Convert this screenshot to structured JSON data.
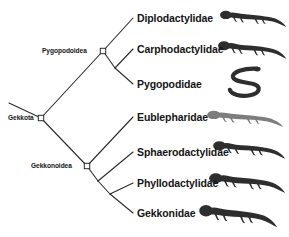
{
  "figure": {
    "type": "phylogenetic-cladogram",
    "background_color": "#ffffff",
    "line_color": "#2b2b2b",
    "text_color": "#151515",
    "node_marker": {
      "shape": "square",
      "fill": "#ffffff",
      "stroke": "#2b2b2b"
    }
  },
  "clade_labels": [
    {
      "id": "gekkota",
      "text": "Gekkota",
      "x": 8,
      "y": 114,
      "node_x": 41,
      "node_y": 118
    },
    {
      "id": "pygopodoidea",
      "text": "Pygopodoidea",
      "x": 42,
      "y": 47,
      "node_x": 103,
      "node_y": 51
    },
    {
      "id": "gekkonoidea",
      "text": "Gekkonoidea",
      "x": 31,
      "y": 162,
      "node_x": 87,
      "node_y": 166
    }
  ],
  "taxa": [
    {
      "id": "diplodactylidae",
      "text": "Diplodactylidae",
      "x": 137,
      "y": 13,
      "tip_x": 133,
      "tip_y": 18
    },
    {
      "id": "carphodactylidae",
      "text": "Carphodactylidae",
      "x": 137,
      "y": 44,
      "tip_x": 133,
      "tip_y": 49
    },
    {
      "id": "pygopodidae",
      "text": "Pygopodidae",
      "x": 137,
      "y": 79,
      "tip_x": 133,
      "tip_y": 84
    },
    {
      "id": "eublepharidae",
      "text": "Eublepharidae",
      "x": 137,
      "y": 112,
      "tip_x": 133,
      "tip_y": 117
    },
    {
      "id": "sphaerodactylidae",
      "text": "Sphaerodactylidae",
      "x": 137,
      "y": 147,
      "tip_x": 133,
      "tip_y": 152
    },
    {
      "id": "phyllodactylidae",
      "text": "Phyllodactylidae",
      "x": 137,
      "y": 178,
      "tip_x": 133,
      "tip_y": 183
    },
    {
      "id": "gekkonidae",
      "text": "Gekkonidae",
      "x": 137,
      "y": 208,
      "tip_x": 133,
      "tip_y": 213
    }
  ],
  "branches": [
    {
      "from": [
        9,
        103
      ],
      "to": [
        41,
        118
      ],
      "name": "root-stem"
    },
    {
      "from": [
        41,
        118
      ],
      "to": [
        103,
        51
      ],
      "name": "gekkota-to-pygopodoidea"
    },
    {
      "from": [
        41,
        118
      ],
      "to": [
        87,
        166
      ],
      "name": "gekkota-to-gekkonoidea"
    },
    {
      "from": [
        103,
        51
      ],
      "to": [
        133,
        18
      ],
      "name": "pygopodoidea-to-diplodactylidae"
    },
    {
      "from": [
        103,
        51
      ],
      "to": [
        115,
        68
      ],
      "name": "pygopodoidea-to-internal"
    },
    {
      "from": [
        115,
        68
      ],
      "to": [
        133,
        49
      ],
      "name": "internal-to-carphodactylidae"
    },
    {
      "from": [
        115,
        68
      ],
      "to": [
        133,
        84
      ],
      "name": "internal-to-pygopodidae"
    },
    {
      "from": [
        87,
        166
      ],
      "to": [
        133,
        117
      ],
      "name": "gekkonoidea-to-eublepharidae"
    },
    {
      "from": [
        87,
        166
      ],
      "to": [
        98,
        181
      ],
      "name": "gekkonoidea-to-internal1"
    },
    {
      "from": [
        98,
        181
      ],
      "to": [
        133,
        152
      ],
      "name": "internal1-to-sphaerodactylidae"
    },
    {
      "from": [
        98,
        181
      ],
      "to": [
        110,
        194
      ],
      "name": "internal1-to-internal2"
    },
    {
      "from": [
        110,
        194
      ],
      "to": [
        133,
        183
      ],
      "name": "internal2-to-phyllodactylidae"
    },
    {
      "from": [
        110,
        194
      ],
      "to": [
        133,
        213
      ],
      "name": "internal2-to-gekkonidae"
    }
  ],
  "gecko_images": [
    {
      "id": "gecko-diplodactylidae",
      "alt_name": "diplodactylid-gecko-photo",
      "x": 219,
      "y": 4,
      "w": 68,
      "h": 28,
      "form": "lizard"
    },
    {
      "id": "gecko-carphodactylidae",
      "alt_name": "carphodactylid-gecko-photo",
      "x": 217,
      "y": 34,
      "w": 70,
      "h": 30,
      "form": "lizard"
    },
    {
      "id": "gecko-pygopodidae",
      "alt_name": "pygopodid-legless-lizard-photo",
      "x": 222,
      "y": 66,
      "w": 56,
      "h": 34,
      "form": "snake"
    },
    {
      "id": "gecko-eublepharidae",
      "alt_name": "eublepharid-gecko-photo",
      "x": 206,
      "y": 104,
      "w": 78,
      "h": 28,
      "form": "lizard-pale"
    },
    {
      "id": "gecko-sphaerodactylidae",
      "alt_name": "sphaerodactylid-gecko-photo",
      "x": 212,
      "y": 134,
      "w": 74,
      "h": 30,
      "form": "lizard"
    },
    {
      "id": "gecko-phyllodactylidae",
      "alt_name": "phyllodactylid-gecko-photo",
      "x": 208,
      "y": 165,
      "w": 78,
      "h": 34,
      "form": "lizard"
    },
    {
      "id": "gecko-gekkonidae",
      "alt_name": "gekkonid-gecko-photo",
      "x": 198,
      "y": 196,
      "w": 80,
      "h": 38,
      "form": "lizard"
    }
  ]
}
